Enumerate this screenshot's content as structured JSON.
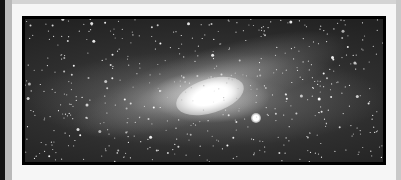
{
  "image": {
    "subject": "Andromeda galaxy (grayscale astrophotograph)",
    "colors": {
      "panel": "#f6f6f6",
      "frame": "#000000",
      "left_stripe": "#111111",
      "left_gray": "#b9b9b9"
    }
  }
}
